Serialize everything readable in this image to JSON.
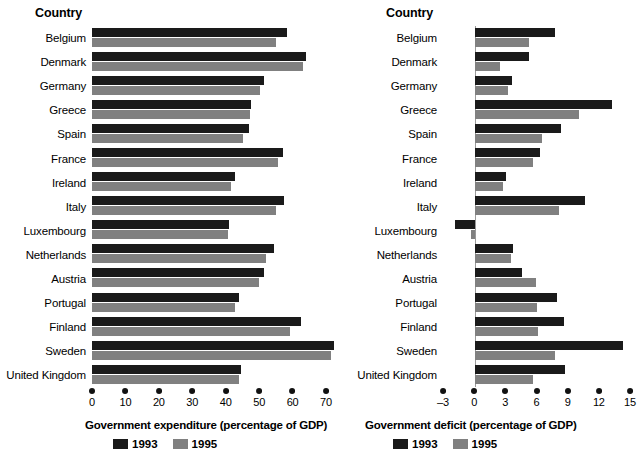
{
  "charts": [
    {
      "column_header": "Country",
      "axis_title": "Government expenditure (percentage of GDP)",
      "legend": [
        {
          "label": "1993",
          "color": "#1a1a1a"
        },
        {
          "label": "1995",
          "color": "#808080"
        }
      ],
      "ticks": [
        "0",
        "10",
        "20",
        "30",
        "40",
        "50",
        "60",
        "70"
      ],
      "countries": [
        "Belgium",
        "Denmark",
        "Germany",
        "Greece",
        "Spain",
        "France",
        "Ireland",
        "Italy",
        "Luxembourg",
        "Netherlands",
        "Austria",
        "Portugal",
        "Finland",
        "Sweden",
        "United Kingdom"
      ]
    },
    {
      "column_header": "Country",
      "axis_title": "Government deficit (percentage of GDP)",
      "legend": [
        {
          "label": "1993",
          "color": "#1a1a1a"
        },
        {
          "label": "1995",
          "color": "#808080"
        }
      ],
      "ticks": [
        "-3",
        "0",
        "3",
        "6",
        "9",
        "12",
        "15"
      ],
      "countries": [
        "Belgium",
        "Denmark",
        "Germany",
        "Greece",
        "Spain",
        "France",
        "Ireland",
        "Italy",
        "Luxembourg",
        "Netherlands",
        "Austria",
        "Portugal",
        "Finland",
        "Sweden",
        "United Kingdom"
      ]
    }
  ],
  "chart_data": [
    {
      "type": "bar",
      "orientation": "horizontal",
      "title": "",
      "xlabel": "Government expenditure (percentage of GDP)",
      "ylabel": "Country",
      "xlim": [
        0,
        70
      ],
      "xticks": [
        0,
        10,
        20,
        30,
        40,
        50,
        60,
        70
      ],
      "grid": false,
      "legend_position": "below-axis-left",
      "categories": [
        "Belgium",
        "Denmark",
        "Germany",
        "Greece",
        "Spain",
        "France",
        "Ireland",
        "Italy",
        "Luxembourg",
        "Netherlands",
        "Austria",
        "Portugal",
        "Finland",
        "Sweden",
        "United Kingdom"
      ],
      "series": [
        {
          "name": "1993",
          "color": "#1a1a1a",
          "values": [
            55.0,
            60.5,
            48.5,
            45.0,
            44.3,
            54.0,
            40.5,
            54.3,
            38.8,
            51.5,
            48.5,
            41.5,
            59.0,
            68.4,
            42.0
          ]
        },
        {
          "name": "1995",
          "color": "#808080",
          "values": [
            52.0,
            59.5,
            47.5,
            44.6,
            42.5,
            52.5,
            39.2,
            51.8,
            38.5,
            49.0,
            47.0,
            40.5,
            56.0,
            67.4,
            41.5
          ]
        }
      ]
    },
    {
      "type": "bar",
      "orientation": "horizontal",
      "title": "",
      "xlabel": "Government deficit (percentage of GDP)",
      "ylabel": "Country",
      "xlim": [
        -3,
        15
      ],
      "xticks": [
        -3,
        0,
        3,
        6,
        9,
        12,
        15
      ],
      "grid": false,
      "legend_position": "below-axis-left",
      "categories": [
        "Belgium",
        "Denmark",
        "Germany",
        "Greece",
        "Spain",
        "France",
        "Ireland",
        "Italy",
        "Luxembourg",
        "Netherlands",
        "Austria",
        "Portugal",
        "Finland",
        "Sweden",
        "United Kingdom"
      ],
      "series": [
        {
          "name": "1993",
          "color": "#1a1a1a",
          "values": [
            7.3,
            4.9,
            3.4,
            12.6,
            7.9,
            6.0,
            2.8,
            10.1,
            -1.9,
            3.5,
            4.3,
            7.5,
            8.2,
            13.6,
            8.3
          ]
        },
        {
          "name": "1995",
          "color": "#808080",
          "values": [
            4.9,
            2.3,
            3.0,
            9.6,
            6.1,
            5.3,
            2.5,
            7.7,
            -0.4,
            3.3,
            5.6,
            5.7,
            5.8,
            7.3,
            5.3
          ]
        }
      ]
    }
  ]
}
